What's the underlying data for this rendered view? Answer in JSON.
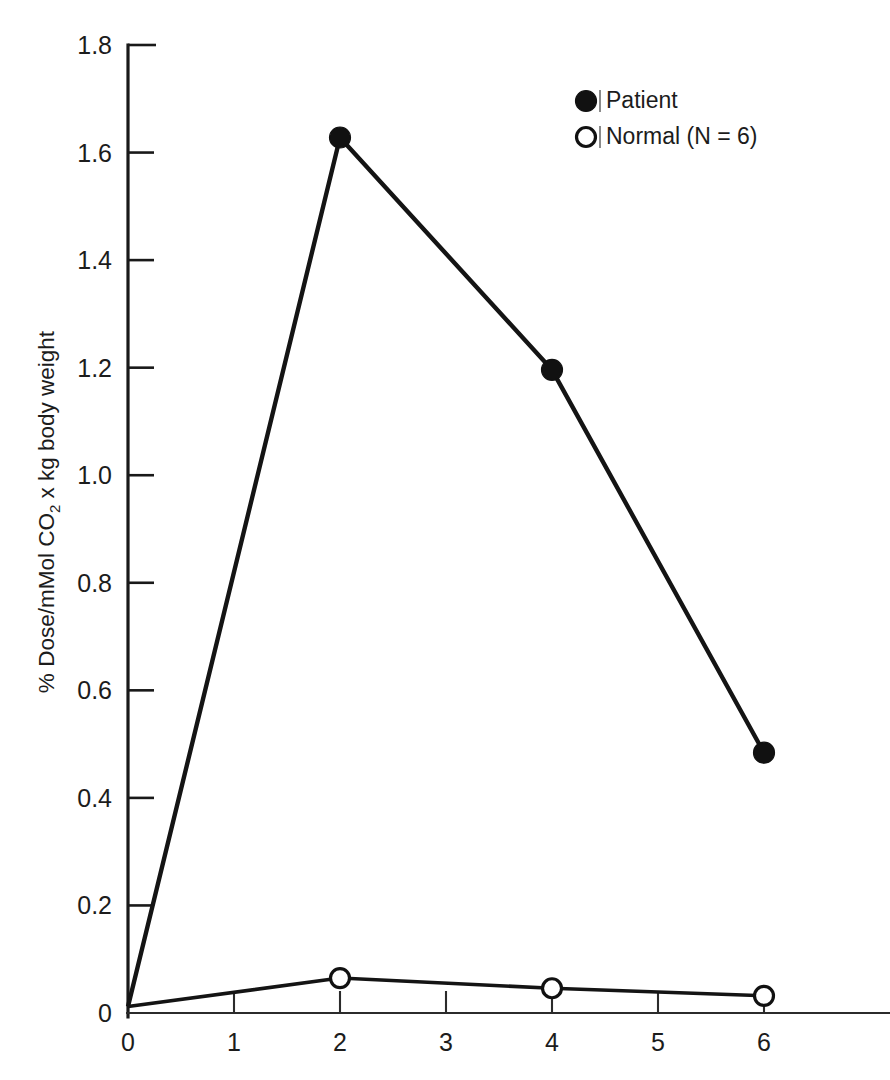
{
  "chart_data": {
    "type": "line",
    "title": "",
    "subtitle": "",
    "xlabel": "",
    "ylabel": "% Dose/mMol CO₂ x kg body weight",
    "ylabel_parts": {
      "pre": "% Dose/mMol CO",
      "sub": "2",
      "post": " x kg body weight"
    },
    "x": [
      0,
      2,
      4,
      6
    ],
    "xlim": [
      0,
      7.9
    ],
    "ylim": [
      0,
      1.8
    ],
    "xticks": [
      0,
      1,
      2,
      3,
      4,
      5,
      6
    ],
    "xtick_labels": [
      "0",
      "1",
      "2",
      "3",
      "4",
      "5",
      "6"
    ],
    "yticks": [
      0,
      0.2,
      0.4,
      0.6,
      0.8,
      1.0,
      1.2,
      1.4,
      1.6,
      1.8
    ],
    "ytick_labels": [
      "0",
      "0.2",
      "0.4",
      "0.6",
      "0.8",
      "1.0",
      "1.2",
      "1.4",
      "1.6",
      "1.8"
    ],
    "grid": false,
    "legend_position": "top-right",
    "series": [
      {
        "name": "Patient",
        "marker": "filled-circle",
        "values": [
          0.012,
          1.628,
          1.196,
          0.484
        ]
      },
      {
        "name": "Normal (N = 6)",
        "marker": "open-circle",
        "values": [
          0.012,
          0.065,
          0.046,
          0.032
        ]
      }
    ]
  },
  "legend": {
    "items": [
      {
        "marker": "filled-circle",
        "separator": "|",
        "label": "Patient"
      },
      {
        "marker": "open-circle",
        "separator": "|",
        "label": "Normal (N = 6)"
      }
    ]
  },
  "colors": {
    "ink": "#141414",
    "axis": "#2b2b2b",
    "background": "#ffffff"
  }
}
